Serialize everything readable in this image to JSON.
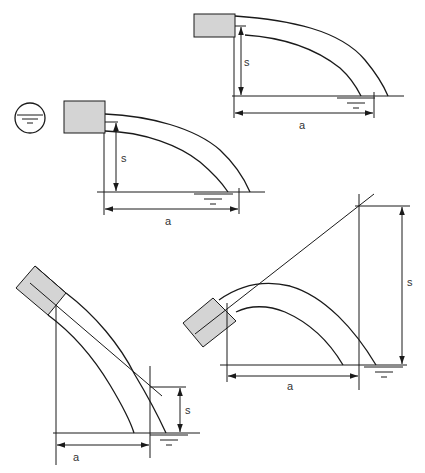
{
  "figure": {
    "colors": {
      "line": "#1a1a1a",
      "nozzle_fill": "#d4d4d4",
      "label": "#333333",
      "background": "#ffffff"
    },
    "symbols": {
      "water_level": "water-surface-icon",
      "level_circle": "water-level-circle-icon"
    }
  },
  "diagrams": [
    {
      "id": "horizontal-jet-top",
      "labels": {
        "height": "s",
        "distance": "a"
      }
    },
    {
      "id": "horizontal-jet-middle",
      "labels": {
        "height": "s",
        "distance": "a"
      }
    },
    {
      "id": "inclined-down-jet",
      "labels": {
        "height": "s",
        "distance": "a"
      }
    },
    {
      "id": "inclined-up-jet",
      "labels": {
        "height": "s",
        "distance": "a"
      }
    }
  ]
}
